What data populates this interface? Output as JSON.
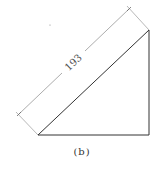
{
  "figure": {
    "dimension_label": "193",
    "caption": "(b)",
    "colors": {
      "shape_stroke": "#333333",
      "dimension_stroke": "#888888",
      "text": "#333333"
    },
    "triangle": {
      "points": [
        [
          38,
          135
        ],
        [
          149,
          30
        ],
        [
          149,
          135
        ]
      ]
    },
    "dimension_line": {
      "from": [
        19,
        114
      ],
      "to": [
        129,
        9
      ]
    }
  }
}
